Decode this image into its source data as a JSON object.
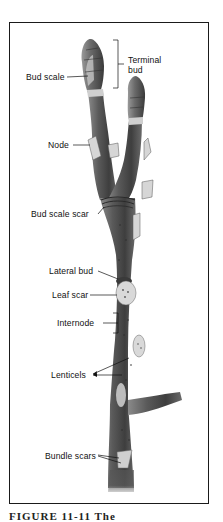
{
  "figure": {
    "caption": "FIGURE 11-11 The",
    "caption_clipped": true
  },
  "labels": {
    "terminal_bud": "Terminal bud",
    "terminal_bud_line1": "Terminal",
    "terminal_bud_line2": "bud",
    "bud_scale": "Bud scale",
    "node": "Node",
    "bud_scale_scar": "Bud scale scar",
    "lateral_bud": "Lateral bud",
    "leaf_scar": "Leaf scar",
    "internode": "Internode",
    "lenticels": "Lenticels",
    "bundle_scars": "Bundle scars"
  },
  "colors": {
    "frame": "#1a1a1a",
    "stem_dark": "#4a4a4a",
    "stem_mid": "#6e6e6e",
    "stem_light": "#9a9a9a",
    "scar": "#d8d8d8",
    "text": "#111111"
  }
}
